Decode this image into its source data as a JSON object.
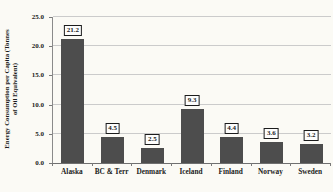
{
  "chart_data": {
    "type": "bar",
    "title": "",
    "categories": [
      "Alaska",
      "BC & Terr",
      "Denmark",
      "Iceland",
      "Finland",
      "Norway",
      "Sweden"
    ],
    "values": [
      21.2,
      4.5,
      2.5,
      9.3,
      4.4,
      3.6,
      3.2
    ],
    "data_labels": [
      "21.2",
      "4.5",
      "2.5",
      "9.3",
      "4.4",
      "3.6",
      "3.2"
    ],
    "ylabel_line1": "Energy Consumption per Capita (Tonnes",
    "ylabel_line2": "of Oil Equivalent)",
    "xlabel": "",
    "ylim": [
      0,
      25
    ],
    "ytick_labels": [
      "0.0",
      "5.0",
      "10.0",
      "15.0",
      "20.0",
      "25.0"
    ],
    "ytick_values": [
      0,
      5,
      10,
      15,
      20,
      25
    ],
    "grid": true,
    "legend": false,
    "bar_color": "#4d4d4d",
    "gridline_color": "#cbcbcb",
    "axis_color": "#7a7a7a",
    "background_color": "#fbfaf5",
    "label_box_border_color": "#1c1c1c",
    "label_box_fill_color": "#fdfdfc"
  }
}
